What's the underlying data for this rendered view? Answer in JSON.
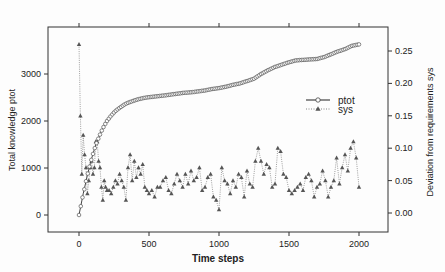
{
  "chart_data": {
    "type": "line",
    "title": "",
    "xlabel": "Time steps",
    "ylabel_left": "Total knowledge ptot",
    "ylabel_right": "Deviation from requirements sys",
    "x_ticks": [
      0,
      500,
      1000,
      1500,
      2000
    ],
    "x_tick_labels": [
      "0",
      "500",
      "1000",
      "1500",
      "2000"
    ],
    "y_left_ticks": [
      0,
      1000,
      2000,
      3000
    ],
    "y_left_tick_labels": [
      "0",
      "1000",
      "2000",
      "3000"
    ],
    "y_right_ticks": [
      0.0,
      0.05,
      0.1,
      0.15,
      0.2,
      0.25
    ],
    "y_right_tick_labels": [
      "0.00",
      "0.05",
      "0.10",
      "0.15",
      "0.20",
      "0.25"
    ],
    "xlim": [
      -230,
      2200
    ],
    "ylim_left": [
      -350,
      3950
    ],
    "ylim_right": [
      -0.028,
      0.28
    ],
    "grid": false,
    "legend_position": "right-middle inside",
    "legend": [
      {
        "name": "ptot",
        "style": "solid line, open circles"
      },
      {
        "name": "sys",
        "style": "dotted line, filled triangles"
      }
    ],
    "series": [
      {
        "name": "ptot",
        "axis": "left",
        "x": [
          0,
          10,
          20,
          30,
          40,
          50,
          60,
          70,
          80,
          90,
          100,
          110,
          120,
          130,
          140,
          150,
          160,
          170,
          180,
          190,
          200,
          220,
          240,
          260,
          280,
          300,
          330,
          360,
          390,
          420,
          450,
          480,
          510,
          540,
          570,
          600,
          650,
          700,
          750,
          800,
          850,
          900,
          950,
          1000,
          1050,
          1100,
          1150,
          1200,
          1250,
          1300,
          1350,
          1400,
          1450,
          1500,
          1550,
          1600,
          1650,
          1700,
          1750,
          1800,
          1850,
          1900,
          1950,
          2000
        ],
        "values": [
          0,
          150,
          300,
          450,
          580,
          720,
          850,
          970,
          1090,
          1200,
          1300,
          1400,
          1490,
          1570,
          1640,
          1710,
          1780,
          1840,
          1900,
          1950,
          2000,
          2080,
          2150,
          2210,
          2260,
          2300,
          2360,
          2400,
          2430,
          2460,
          2480,
          2500,
          2510,
          2520,
          2530,
          2540,
          2560,
          2580,
          2600,
          2610,
          2630,
          2650,
          2680,
          2700,
          2730,
          2770,
          2800,
          2850,
          2900,
          3000,
          3080,
          3150,
          3200,
          3250,
          3290,
          3300,
          3310,
          3320,
          3360,
          3420,
          3480,
          3530,
          3600,
          3630
        ]
      },
      {
        "name": "sys",
        "axis": "right",
        "x": [
          0,
          10,
          20,
          30,
          40,
          50,
          60,
          70,
          80,
          90,
          100,
          110,
          120,
          130,
          140,
          150,
          160,
          170,
          180,
          190,
          200,
          215,
          230,
          245,
          260,
          275,
          290,
          305,
          320,
          335,
          350,
          365,
          380,
          395,
          410,
          425,
          440,
          455,
          470,
          485,
          500,
          520,
          540,
          560,
          580,
          600,
          620,
          640,
          660,
          680,
          700,
          720,
          740,
          760,
          780,
          800,
          820,
          840,
          860,
          880,
          900,
          920,
          940,
          960,
          980,
          1000,
          1020,
          1040,
          1060,
          1080,
          1100,
          1120,
          1140,
          1160,
          1180,
          1200,
          1220,
          1240,
          1260,
          1280,
          1300,
          1320,
          1340,
          1360,
          1380,
          1400,
          1420,
          1440,
          1460,
          1480,
          1500,
          1520,
          1540,
          1560,
          1580,
          1600,
          1620,
          1640,
          1660,
          1680,
          1700,
          1720,
          1740,
          1760,
          1780,
          1800,
          1820,
          1840,
          1860,
          1880,
          1900,
          1920,
          1940,
          1960,
          1980,
          2000
        ],
        "values": [
          0.26,
          0.15,
          0.06,
          0.12,
          0.09,
          0.07,
          0.03,
          0.05,
          0.07,
          0.08,
          0.06,
          0.07,
          0.11,
          0.11,
          0.08,
          0.07,
          0.04,
          0.02,
          0.05,
          0.04,
          0.035,
          0.035,
          0.03,
          0.04,
          0.05,
          0.045,
          0.06,
          0.05,
          0.04,
          0.02,
          0.07,
          0.09,
          0.05,
          0.08,
          0.055,
          0.07,
          0.06,
          0.075,
          0.04,
          0.035,
          0.03,
          0.035,
          0.025,
          0.04,
          0.04,
          0.05,
          0.055,
          0.035,
          0.03,
          0.045,
          0.06,
          0.05,
          0.04,
          0.06,
          0.045,
          0.065,
          0.05,
          0.055,
          0.07,
          0.035,
          0.04,
          0.055,
          0.06,
          0.025,
          0.02,
          0.005,
          0.07,
          0.05,
          0.045,
          0.03,
          0.05,
          0.04,
          0.06,
          0.055,
          0.025,
          0.065,
          0.045,
          0.04,
          0.08,
          0.1,
          0.08,
          0.06,
          0.075,
          0.07,
          0.04,
          0.045,
          0.1,
          0.095,
          0.06,
          0.055,
          0.035,
          0.03,
          0.035,
          0.04,
          0.045,
          0.035,
          0.055,
          0.06,
          0.05,
          0.025,
          0.04,
          0.045,
          0.065,
          0.05,
          0.025,
          0.04,
          0.05,
          0.085,
          0.045,
          0.07,
          0.09,
          0.065,
          0.1,
          0.11,
          0.085,
          0.04
        ]
      }
    ]
  },
  "colors": {
    "line": "#444444",
    "marker": "#555555",
    "frame": "#333333",
    "background": "#fdfdfd"
  }
}
